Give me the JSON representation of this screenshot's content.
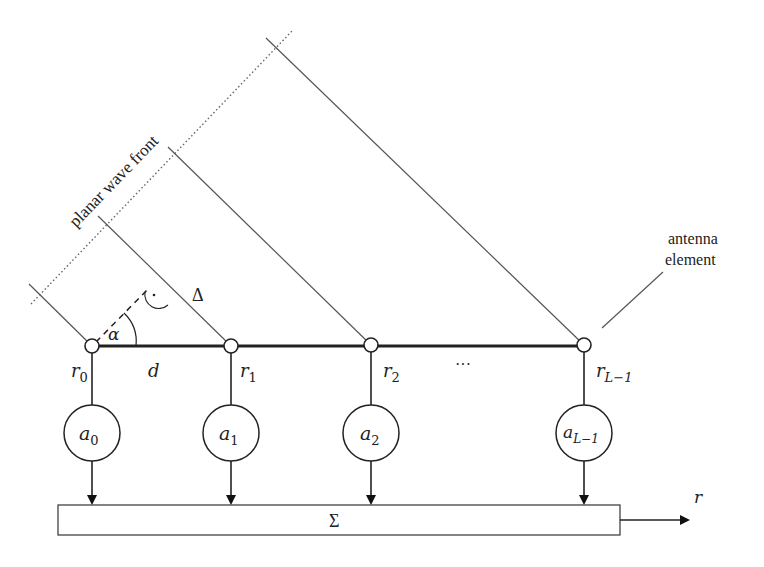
{
  "diagram": {
    "labels": {
      "wave_front": "planar wave front",
      "antenna_element_line1": "antenna",
      "antenna_element_line2": "element",
      "alpha": "α",
      "delta": "Δ",
      "spacing": "d",
      "ellipsis": "···",
      "sum": "Σ",
      "output": "r"
    },
    "elements": [
      {
        "r_base": "r",
        "r_sub": "0",
        "a_base": "a",
        "a_sub": "0"
      },
      {
        "r_base": "r",
        "r_sub": "1",
        "a_base": "a",
        "a_sub": "1"
      },
      {
        "r_base": "r",
        "r_sub": "2",
        "a_base": "a",
        "a_sub": "2"
      },
      {
        "r_base": "r",
        "r_sub": "L−1",
        "a_base": "a",
        "a_sub": "L−1"
      }
    ]
  }
}
